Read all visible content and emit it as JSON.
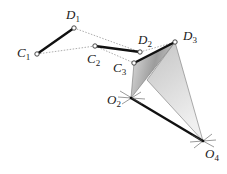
{
  "diagram": {
    "points": {
      "C1": {
        "label": "C",
        "sub": "1",
        "x": 37,
        "y": 54
      },
      "D1": {
        "label": "D",
        "sub": "1",
        "x": 74,
        "y": 28
      },
      "C2": {
        "label": "C",
        "sub": "2",
        "x": 95,
        "y": 46
      },
      "D2": {
        "label": "D",
        "sub": "2",
        "x": 140,
        "y": 52
      },
      "C3": {
        "label": "C",
        "sub": "3",
        "x": 134,
        "y": 63
      },
      "D3": {
        "label": "D",
        "sub": "3",
        "x": 175,
        "y": 42
      },
      "O2": {
        "label": "O",
        "sub": "2",
        "x": 131,
        "y": 98
      },
      "O4": {
        "label": "O",
        "sub": "4",
        "x": 203,
        "y": 141
      }
    },
    "labels": {
      "C1": "C",
      "C1_sub": "1",
      "D1": "D",
      "D1_sub": "1",
      "C2": "C",
      "C2_sub": "2",
      "D2": "D",
      "D2_sub": "2",
      "C3": "C",
      "C3_sub": "3",
      "D3": "D",
      "D3_sub": "3",
      "O2": "O",
      "O2_sub": "2",
      "O4": "O",
      "O4_sub": "4"
    },
    "colors": {
      "link": "#111111",
      "dotted": "#888888",
      "shade_dark": "#9a9a9a",
      "shade_light": "#d6d6d6",
      "background": "#ffffff"
    }
  }
}
